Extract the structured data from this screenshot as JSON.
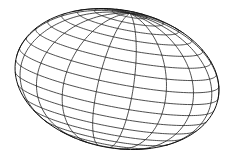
{
  "figure": {
    "line_color": "#222222",
    "outline_color": "#111111",
    "background": "#ffffff",
    "grid": {
      "latitude_step_deg": 10,
      "longitude_step_deg": 20
    },
    "projection": {
      "tilt_deg": 14,
      "spin_deg": 10,
      "radius_x": 103,
      "radius_y": 69,
      "rotation_deg": 11,
      "center_x": 117,
      "center_y": 79
    }
  }
}
